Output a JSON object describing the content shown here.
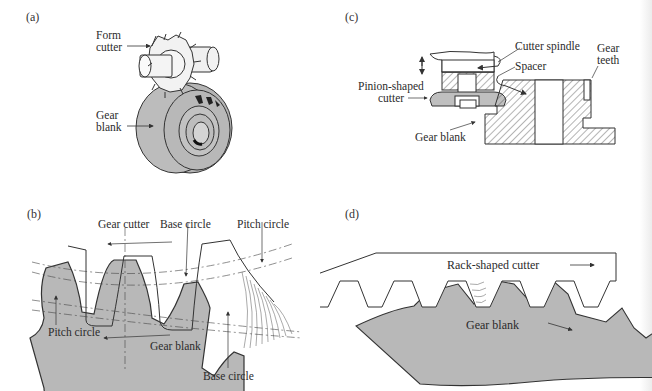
{
  "figure": {
    "panels": [
      {
        "id": "a",
        "tag": "(a)",
        "labels": {
          "form_cutter_1": "Form",
          "form_cutter_2": "cutter",
          "gear_blank_1": "Gear",
          "gear_blank_2": "blank"
        }
      },
      {
        "id": "b",
        "tag": "(b)",
        "labels": {
          "gear_cutter": "Gear cutter",
          "base_circle_top": "Base circle",
          "pitch_circle_top": "Pitch circle",
          "pitch_circle_left": "Pitch circle",
          "gear_blank": "Gear blank",
          "base_circle_bottom": "Base circle"
        }
      },
      {
        "id": "c",
        "tag": "(c)",
        "labels": {
          "cutter_spindle": "Cutter spindle",
          "spacer": "Spacer",
          "gear_teeth_1": "Gear",
          "gear_teeth_2": "teeth",
          "pinion_1": "Pinion-shaped",
          "pinion_2": "cutter",
          "gear_blank": "Gear blank"
        }
      },
      {
        "id": "d",
        "tag": "(d)",
        "labels": {
          "rack_cutter": "Rack-shaped cutter",
          "gear_blank": "Gear blank"
        }
      }
    ],
    "colors": {
      "blank_fill": "#b8b8b8",
      "line": "#333333",
      "background": "#ffffff",
      "cutter_fill": "#f4f4f4"
    }
  }
}
